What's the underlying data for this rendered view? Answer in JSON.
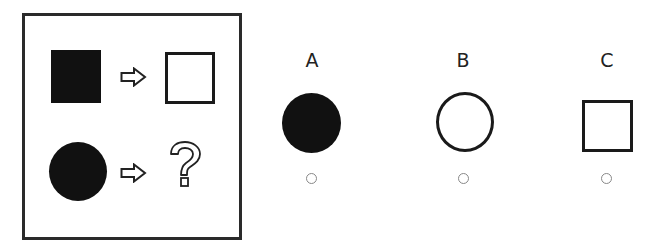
{
  "puzzle": {
    "rows": [
      {
        "input": "filled-square",
        "arrow": "hollow-right-arrow",
        "output": "outline-square"
      },
      {
        "input": "filled-circle",
        "arrow": "hollow-right-arrow",
        "output": "question-mark"
      }
    ],
    "question_mark": "?"
  },
  "options": [
    {
      "label": "A",
      "shape": "filled-circle",
      "selected": false
    },
    {
      "label": "B",
      "shape": "outline-circle",
      "selected": false
    },
    {
      "label": "C",
      "shape": "outline-square",
      "selected": false
    }
  ],
  "colors": {
    "shape_fill": "#111111",
    "border": "#2a2a2a",
    "radio_border": "#888888"
  }
}
